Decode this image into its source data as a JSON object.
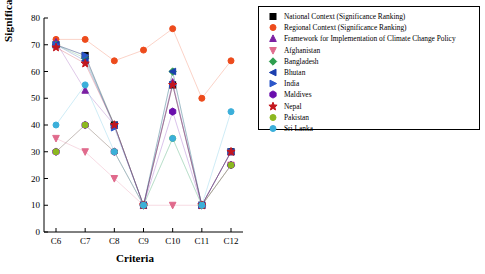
{
  "chart_data": {
    "type": "line",
    "title": "",
    "xlabel": "Criteria",
    "ylabel": "Significance Ranking",
    "categories": [
      "C6",
      "C7",
      "C8",
      "C9",
      "C10",
      "C11",
      "C12"
    ],
    "ylim": [
      0,
      80
    ],
    "yticks": [
      0,
      10,
      20,
      30,
      40,
      50,
      60,
      70,
      80
    ],
    "grid": false,
    "legend_position": "right",
    "series": [
      {
        "name": "National Context (Significance Ranking)",
        "color": "#000000",
        "marker": "square",
        "values": [
          70,
          66,
          40,
          10,
          55,
          10,
          30
        ]
      },
      {
        "name": "Regional Context (Significance Ranking)",
        "color": "#ED4B1C",
        "marker": "circle",
        "values": [
          72,
          72,
          64,
          68,
          76,
          50,
          64
        ]
      },
      {
        "name": "Framework for Implementation of Climate Change Policy",
        "color": "#7B1FA2",
        "marker": "triangle-up",
        "values": [
          71,
          53,
          40,
          10,
          56,
          10,
          30
        ]
      },
      {
        "name": "Afghanistan",
        "color": "#E06A8C",
        "marker": "triangle-down",
        "values": [
          35,
          30,
          20,
          10,
          10,
          10,
          25
        ]
      },
      {
        "name": "Bangladesh",
        "color": "#2E9E4F",
        "marker": "diamond",
        "values": [
          70,
          65,
          40,
          10,
          60,
          10,
          25
        ]
      },
      {
        "name": "Bhutan",
        "color": "#1B3FAE",
        "marker": "triangle-left",
        "values": [
          70,
          64,
          40,
          10,
          60,
          10,
          30
        ]
      },
      {
        "name": "India",
        "color": "#2B56C9",
        "marker": "triangle-right",
        "values": [
          70,
          66,
          39,
          10,
          55,
          10,
          30
        ]
      },
      {
        "name": "Maldives",
        "color": "#6A0DAD",
        "marker": "hexagon",
        "values": [
          30,
          40,
          30,
          10,
          45,
          10,
          25
        ]
      },
      {
        "name": "Nepal",
        "color": "#C4161C",
        "marker": "star",
        "values": [
          69,
          63,
          40,
          10,
          55,
          10,
          30
        ]
      },
      {
        "name": "Pakistan",
        "color": "#8CB820",
        "marker": "circle-olive",
        "values": [
          30,
          40,
          30,
          10,
          35,
          10,
          25
        ]
      },
      {
        "name": "Sri Lanka",
        "color": "#3BAFDA",
        "marker": "circle-cyan",
        "values": [
          40,
          55,
          30,
          10,
          35,
          10,
          45
        ]
      }
    ]
  },
  "legend": {
    "items": [
      {
        "label": "National Context (Significance Ranking)"
      },
      {
        "label": "Regional Context (Significance Ranking)"
      },
      {
        "label": "Framework for Implementation of Climate Change Policy"
      },
      {
        "label": "Afghanistan"
      },
      {
        "label": "Bangladesh"
      },
      {
        "label": "Bhutan"
      },
      {
        "label": "India"
      },
      {
        "label": "Maldives"
      },
      {
        "label": "Nepal"
      },
      {
        "label": "Pakistan"
      },
      {
        "label": "Sri Lanka"
      }
    ]
  },
  "axes": {
    "x_title": "Criteria",
    "y_title": "Significance Ranking"
  }
}
